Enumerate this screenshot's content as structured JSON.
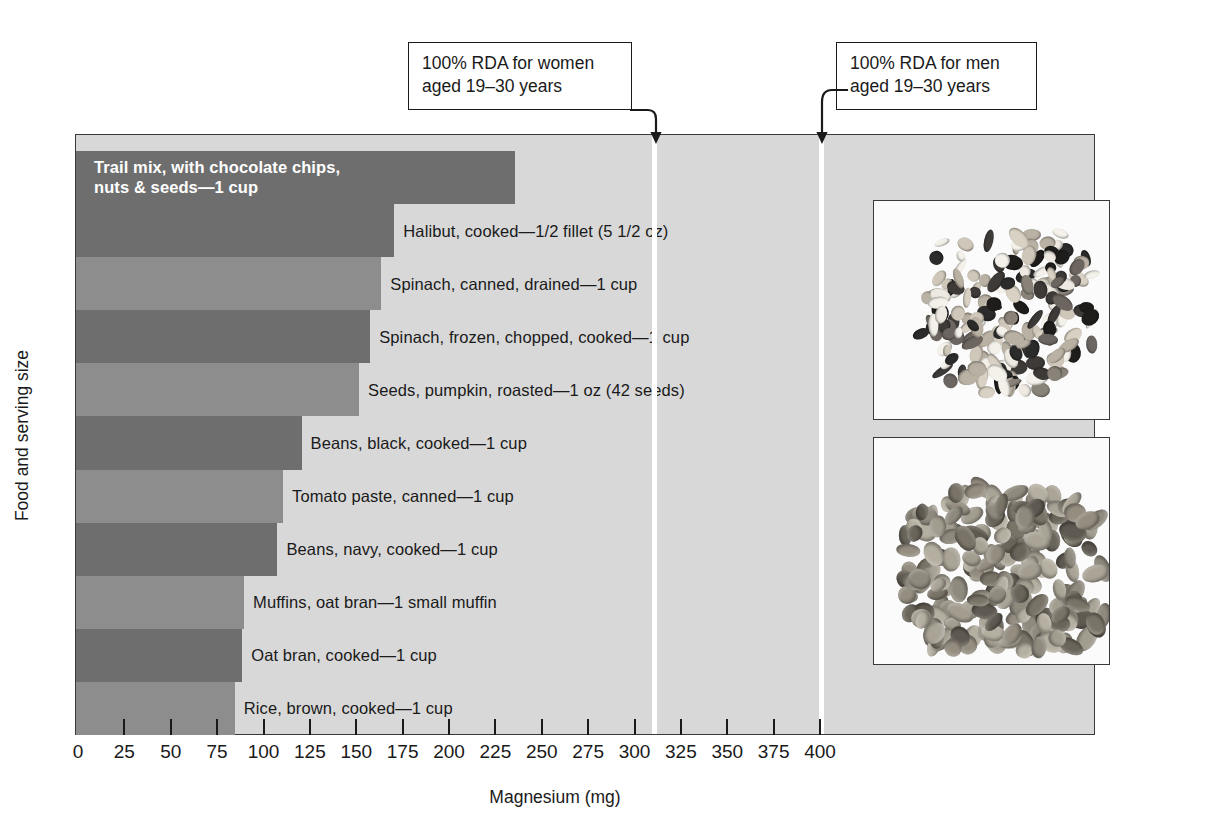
{
  "chart_data": {
    "type": "bar",
    "orientation": "horizontal",
    "title": "",
    "xlabel": "Magnesium (mg)",
    "ylabel": "Food and serving size",
    "xlim": [
      0,
      425
    ],
    "xticks": [
      0,
      25,
      50,
      75,
      100,
      125,
      150,
      175,
      200,
      225,
      250,
      275,
      300,
      325,
      350,
      375,
      400
    ],
    "xtick_labels": [
      "0",
      "25",
      "50",
      "75",
      "100",
      "125",
      "150",
      "175",
      "200",
      "225",
      "250",
      "275",
      "300",
      "325",
      "350",
      "375",
      "400"
    ],
    "grid": false,
    "legend": "none",
    "categories": [
      "Trail mix, with chocolate chips, nuts & seeds—1 cup",
      "Halibut, cooked—1/2 fillet (5 1/2 oz)",
      "Spinach, canned, drained—1 cup",
      "Spinach, frozen, chopped, cooked—1 cup",
      "Seeds, pumpkin, roasted—1 oz (42 seeds)",
      "Beans, black, cooked—1 cup",
      "Tomato paste, canned—1 cup",
      "Beans, navy, cooked—1 cup",
      "Muffins, oat bran—1 small muffin",
      "Oat bran, cooked—1 cup",
      "Rice, brown, cooked—1 cup"
    ],
    "values": [
      235,
      170,
      163,
      157,
      151,
      120,
      110,
      107,
      89,
      88,
      84
    ],
    "annotations": [
      {
        "label": "100% RDA for women aged 19–30 years",
        "value": 310
      },
      {
        "label": "100% RDA for men aged 19–30 years",
        "value": 400
      }
    ]
  },
  "axis": {
    "x_title": "Magnesium (mg)",
    "y_title": "Food and serving size",
    "ticks": [
      "0",
      "25",
      "50",
      "75",
      "100",
      "125",
      "150",
      "175",
      "200",
      "225",
      "250",
      "275",
      "300",
      "325",
      "350",
      "375",
      "400"
    ]
  },
  "bars": [
    {
      "label": "Trail mix, with chocolate chips,\nnuts & seeds—1 cup",
      "value": 235,
      "shade": "dark",
      "label_position": "inside"
    },
    {
      "label": "Halibut, cooked—1/2 fillet (5 1/2 oz)",
      "value": 170,
      "shade": "dark",
      "label_position": "outside"
    },
    {
      "label": "Spinach, canned, drained—1 cup",
      "value": 163,
      "shade": "light",
      "label_position": "outside"
    },
    {
      "label": "Spinach, frozen, chopped, cooked—1 cup",
      "value": 157,
      "shade": "dark",
      "label_position": "outside"
    },
    {
      "label": "Seeds, pumpkin, roasted—1 oz (42 seeds)",
      "value": 151,
      "shade": "light",
      "label_position": "outside"
    },
    {
      "label": "Beans, black, cooked—1 cup",
      "value": 120,
      "shade": "dark",
      "label_position": "outside"
    },
    {
      "label": "Tomato paste, canned—1 cup",
      "value": 110,
      "shade": "light",
      "label_position": "outside"
    },
    {
      "label": "Beans, navy, cooked—1 cup",
      "value": 107,
      "shade": "dark",
      "label_position": "outside"
    },
    {
      "label": "Muffins, oat bran—1 small muffin",
      "value": 89,
      "shade": "light",
      "label_position": "outside"
    },
    {
      "label": "Oat bran, cooked—1 cup",
      "value": 88,
      "shade": "dark",
      "label_position": "outside"
    },
    {
      "label": "Rice, brown, cooked—1 cup",
      "value": 84,
      "shade": "light",
      "label_position": "outside"
    }
  ],
  "callouts": {
    "women": {
      "text": "100% RDA for women\naged 19–30 years",
      "value": 310
    },
    "men": {
      "text": "100% RDA for men\naged 19–30 years",
      "value": 400
    }
  },
  "photos": [
    {
      "name": "trail-mix-photo",
      "caption": ""
    },
    {
      "name": "pumpkin-seeds-photo",
      "caption": ""
    }
  ],
  "colors": {
    "plot_background": "#d8d8d8",
    "bar_dark": "#6e6e6e",
    "bar_light": "#8d8d8d",
    "reference_line": "#ffffff",
    "text": "#1a1a1a"
  }
}
